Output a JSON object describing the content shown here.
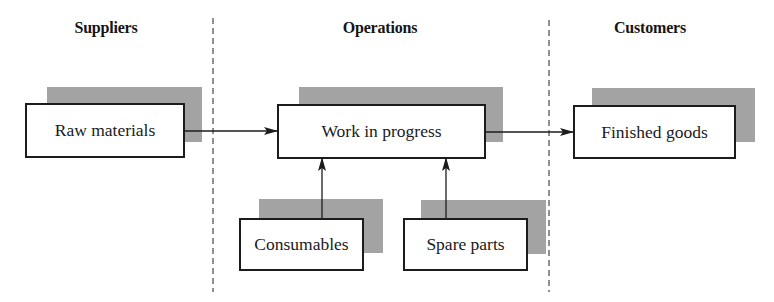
{
  "diagram": {
    "type": "flow",
    "zones": [
      {
        "id": "suppliers",
        "label": "Suppliers"
      },
      {
        "id": "operations",
        "label": "Operations"
      },
      {
        "id": "customers",
        "label": "Customers"
      }
    ],
    "nodes": {
      "raw_materials": {
        "label": "Raw materials",
        "zone": "suppliers"
      },
      "work_in_progress": {
        "label": "Work in progress",
        "zone": "operations"
      },
      "finished_goods": {
        "label": "Finished goods",
        "zone": "customers"
      },
      "consumables": {
        "label": "Consumables",
        "zone": "operations"
      },
      "spare_parts": {
        "label": "Spare parts",
        "zone": "operations"
      }
    },
    "edges": [
      {
        "from": "raw_materials",
        "to": "work_in_progress"
      },
      {
        "from": "work_in_progress",
        "to": "finished_goods"
      },
      {
        "from": "consumables",
        "to": "work_in_progress"
      },
      {
        "from": "spare_parts",
        "to": "work_in_progress"
      }
    ],
    "colors": {
      "line": "#1c1c1c",
      "shadow": "#b8b8b8",
      "divider": "#555555"
    }
  }
}
